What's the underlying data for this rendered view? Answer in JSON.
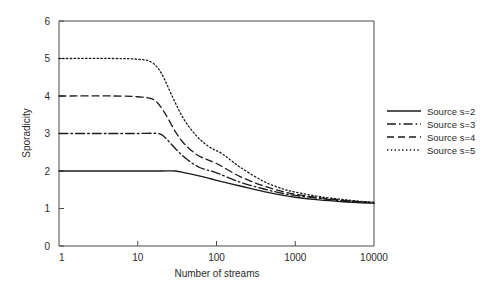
{
  "chart_data": {
    "type": "line",
    "title": "",
    "xlabel": "Number of streams",
    "ylabel": "Sporadicity",
    "xscale": "log",
    "xlim": [
      1,
      10000
    ],
    "ylim": [
      0,
      6
    ],
    "yticks": [
      "0",
      "1",
      "2",
      "3",
      "4",
      "5",
      "6"
    ],
    "ytick_values": [
      0,
      1,
      2,
      3,
      4,
      5,
      6
    ],
    "xticks": [
      "1",
      "10",
      "100",
      "1000",
      "10000"
    ],
    "xtick_values": [
      1,
      10,
      100,
      1000,
      10000
    ],
    "grid": false,
    "legend_position": "right-outside",
    "series": [
      {
        "name": "Source s=2",
        "style": "solid",
        "x": [
          1,
          5,
          10,
          20,
          30,
          40,
          60,
          100,
          200,
          400,
          700,
          1000,
          2000,
          4000,
          7000,
          10000
        ],
        "y": [
          2.0,
          2.0,
          2.0,
          2.0,
          2.0,
          1.95,
          1.87,
          1.75,
          1.6,
          1.45,
          1.35,
          1.3,
          1.23,
          1.18,
          1.15,
          1.14
        ]
      },
      {
        "name": "Source s=3",
        "style": "dashdot",
        "x": [
          1,
          5,
          10,
          18,
          22,
          30,
          40,
          60,
          100,
          200,
          400,
          700,
          1000,
          2000,
          4000,
          7000,
          10000
        ],
        "y": [
          3.0,
          3.0,
          3.0,
          3.0,
          2.9,
          2.6,
          2.35,
          2.1,
          1.95,
          1.7,
          1.52,
          1.4,
          1.35,
          1.27,
          1.2,
          1.17,
          1.15
        ]
      },
      {
        "name": "Source s=4",
        "style": "dashed",
        "x": [
          1,
          5,
          10,
          16,
          22,
          30,
          40,
          60,
          100,
          200,
          400,
          700,
          1000,
          2000,
          4000,
          7000,
          10000
        ],
        "y": [
          4.0,
          4.0,
          3.98,
          3.9,
          3.55,
          3.05,
          2.7,
          2.4,
          2.2,
          1.85,
          1.6,
          1.45,
          1.38,
          1.29,
          1.22,
          1.18,
          1.16
        ]
      },
      {
        "name": "Source s=5",
        "style": "dotted",
        "x": [
          1,
          5,
          10,
          15,
          20,
          28,
          38,
          55,
          80,
          120,
          200,
          400,
          700,
          1000,
          2000,
          4000,
          7000,
          10000
        ],
        "y": [
          5.0,
          5.0,
          4.98,
          4.9,
          4.6,
          3.95,
          3.4,
          2.95,
          2.65,
          2.45,
          2.1,
          1.72,
          1.52,
          1.44,
          1.32,
          1.24,
          1.19,
          1.17
        ]
      }
    ],
    "legend_entries": [
      {
        "label": "Source s=2",
        "style": "solid"
      },
      {
        "label": "Source s=3",
        "style": "dashdot"
      },
      {
        "label": "Source s=4",
        "style": "dashed"
      },
      {
        "label": "Source s=5",
        "style": "dotted"
      }
    ],
    "colors": {
      "line": "#1a1a1a",
      "axis": "#4a4a4a",
      "text": "#2b2b2b",
      "background": "#ffffff"
    }
  }
}
